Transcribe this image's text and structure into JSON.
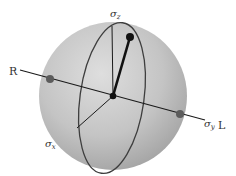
{
  "diagram": {
    "labels": {
      "sigma_z": "σ",
      "sigma_z_sub": "z",
      "sigma_y": "σ",
      "sigma_y_sub": "y",
      "sigma_x": "σ",
      "sigma_x_sub": "x",
      "right": "R",
      "left": "L"
    },
    "colors": {
      "sphere_light": "#dcdcdc",
      "sphere_dark": "#a4a4a4",
      "line": "#1a1a1a",
      "ellipse": "#3a3a3a",
      "pole_dot": "#5a5a5a",
      "vector": "#111111"
    }
  }
}
